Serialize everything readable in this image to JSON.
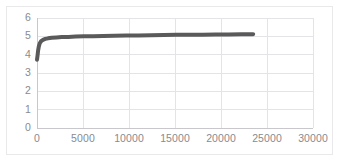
{
  "chart_data": {
    "type": "line",
    "title": "",
    "subtitle": "",
    "xlabel": "",
    "ylabel": "",
    "xlim": [
      0,
      30000
    ],
    "ylim": [
      0,
      6
    ],
    "grid": true,
    "legend": false,
    "legend_position": "none",
    "x_ticks": [
      0,
      5000,
      10000,
      15000,
      20000,
      25000,
      30000
    ],
    "x_tick_labels": [
      "0",
      "5000",
      "10000",
      "15000",
      "20000",
      "25000",
      "30000"
    ],
    "y_ticks": [
      0,
      1,
      2,
      3,
      4,
      5,
      6
    ],
    "y_tick_labels": [
      "0",
      "1",
      "2",
      "3",
      "4",
      "5",
      "6"
    ],
    "series": [
      {
        "name": "series-1",
        "color": "#5a5a5a",
        "line_width": 4,
        "x": [
          0,
          60,
          120,
          200,
          300,
          450,
          650,
          900,
          1200,
          1600,
          2100,
          2700,
          3400,
          4200,
          5100,
          6100,
          7200,
          8400,
          9700,
          11000,
          12400,
          13800,
          15200,
          16600,
          18000,
          19400,
          20800,
          22200,
          23500
        ],
        "y": [
          3.72,
          3.95,
          4.22,
          4.45,
          4.62,
          4.74,
          4.81,
          4.86,
          4.89,
          4.92,
          4.94,
          4.96,
          4.97,
          4.99,
          5.0,
          5.01,
          5.02,
          5.03,
          5.04,
          5.05,
          5.06,
          5.07,
          5.08,
          5.085,
          5.09,
          5.1,
          5.105,
          5.11,
          5.12
        ]
      }
    ],
    "annotations": []
  },
  "style": {
    "plot_background": "#ffffff",
    "grid_color": "#e3e3e8",
    "axis_color": "#c8c8cc",
    "tick_text_color": "#8a8a8e",
    "frame_color": "#e9e9ec"
  }
}
